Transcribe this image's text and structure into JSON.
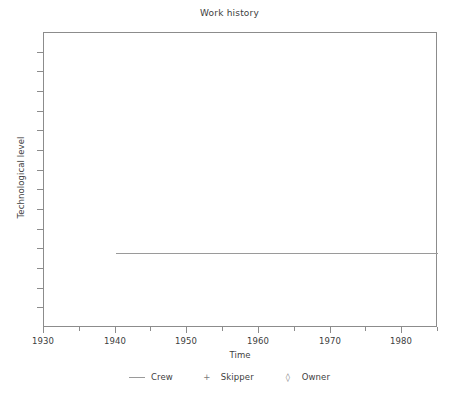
{
  "chart_data": {
    "type": "line",
    "title": "Work history",
    "xlabel": "Time",
    "ylabel": "Technological level",
    "xlim": [
      1930,
      1985
    ],
    "ylim": [
      0,
      1
    ],
    "grid": false,
    "legend_position": "bottom",
    "x_ticks": [
      {
        "value": 1930,
        "label": "1930",
        "major": true
      },
      {
        "value": 1935,
        "label": "",
        "major": false
      },
      {
        "value": 1940,
        "label": "1940",
        "major": true
      },
      {
        "value": 1945,
        "label": "",
        "major": false
      },
      {
        "value": 1950,
        "label": "1950",
        "major": true
      },
      {
        "value": 1955,
        "label": "",
        "major": false
      },
      {
        "value": 1960,
        "label": "1960",
        "major": true
      },
      {
        "value": 1965,
        "label": "",
        "major": false
      },
      {
        "value": 1970,
        "label": "1970",
        "major": true
      },
      {
        "value": 1975,
        "label": "",
        "major": false
      },
      {
        "value": 1980,
        "label": "1980",
        "major": true
      },
      {
        "value": 1985,
        "label": "",
        "major": false
      }
    ],
    "y_ticks_unlabeled_count": 14,
    "series": [
      {
        "name": "Crew",
        "marker": "line",
        "marker_glyph": "—",
        "color": "#9a9a9a",
        "x": [
          1940,
          1985
        ],
        "values": [
          0.255,
          0.255
        ],
        "points": [
          [
            1940,
            0.255
          ],
          [
            1985,
            0.255
          ]
        ]
      },
      {
        "name": "Skipper",
        "marker": "plus",
        "marker_glyph": "+",
        "color": "#7a7a7a",
        "x": [],
        "values": [],
        "points": []
      },
      {
        "name": "Owner",
        "marker": "diamond",
        "marker_glyph": "◊",
        "color": "#7a7a7a",
        "x": [],
        "values": [],
        "points": []
      }
    ]
  },
  "legend": {
    "items": [
      {
        "marker": "—",
        "label": "Crew"
      },
      {
        "marker": "+",
        "label": "Skipper"
      },
      {
        "marker": "◊",
        "label": "Owner"
      }
    ]
  }
}
